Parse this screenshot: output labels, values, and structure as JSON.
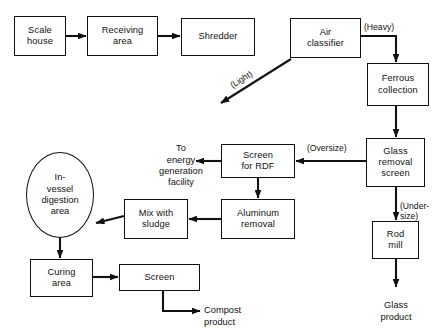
{
  "diagram": {
    "stroke_color": "#111111",
    "background_color": "#ffffff",
    "nodes": [
      {
        "id": "scale_house",
        "label": "Scale\nhouse",
        "shape": "rect"
      },
      {
        "id": "receiving_area",
        "label": "Receiving\narea",
        "shape": "rect"
      },
      {
        "id": "shredder",
        "label": "Shredder",
        "shape": "rect"
      },
      {
        "id": "air_classifier",
        "label": "Air\nclassifier",
        "shape": "rect"
      },
      {
        "id": "ferrous_collection",
        "label": "Ferrous\ncollection",
        "shape": "rect"
      },
      {
        "id": "glass_removal",
        "label": "Glass\nremoval\nscreen",
        "shape": "rect"
      },
      {
        "id": "rod_mill",
        "label": "Rod\nmill",
        "shape": "rect"
      },
      {
        "id": "screen_for_rdf",
        "label": "Screen\nfor RDF",
        "shape": "rect"
      },
      {
        "id": "aluminum_removal",
        "label": "Aluminum\nremoval",
        "shape": "rect"
      },
      {
        "id": "mix_with_sludge",
        "label": "Mix with\nsludge",
        "shape": "rect"
      },
      {
        "id": "in_vessel",
        "label": "In-\nvessel\ndigestion\narea",
        "shape": "ellipse"
      },
      {
        "id": "curing_area",
        "label": "Curing\narea",
        "shape": "rect"
      },
      {
        "id": "screen",
        "label": "Screen",
        "shape": "rect"
      }
    ],
    "terminal_labels": [
      {
        "id": "energy_facility",
        "label": "To\nenergy\ngeneration\nfacility"
      },
      {
        "id": "glass_product",
        "label": "Glass\nproduct"
      },
      {
        "id": "compost_product",
        "label": "Compost\nproduct"
      }
    ],
    "edge_labels": [
      {
        "id": "heavy",
        "label": "(Heavy)"
      },
      {
        "id": "light",
        "label": "(Light)"
      },
      {
        "id": "oversize",
        "label": "(Oversize)"
      },
      {
        "id": "undersize",
        "label": "(Under-\nsize)"
      }
    ]
  }
}
